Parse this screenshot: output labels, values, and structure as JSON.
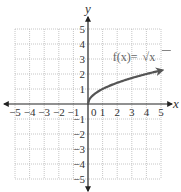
{
  "chart_data": {
    "type": "line",
    "title": "",
    "xlabel": "x",
    "ylabel": "y",
    "xlim": [
      -5,
      5
    ],
    "ylim": [
      -5,
      5
    ],
    "grid": true,
    "grid_style": "dotted",
    "x_ticks": [
      -5,
      -4,
      -3,
      -2,
      -1,
      0,
      1,
      2,
      3,
      4,
      5
    ],
    "y_ticks": [
      -5,
      -4,
      -3,
      -2,
      -1,
      1,
      2,
      3,
      4,
      5
    ],
    "x_tick_labels": [
      "−5",
      "−4",
      "−3",
      "−2",
      "−1",
      "0",
      "1",
      "2",
      "3",
      "4",
      "5"
    ],
    "y_tick_labels": [
      "−5",
      "−4",
      "−3",
      "−2",
      "−1",
      "1",
      "2",
      "3",
      "4",
      "5"
    ],
    "series": [
      {
        "name": "f(x) = √x",
        "function": "sqrt(x)",
        "domain": [
          0,
          5
        ],
        "x": [
          0,
          0.25,
          0.5,
          1,
          1.5,
          2,
          2.5,
          3,
          3.5,
          4,
          4.5,
          5
        ],
        "y": [
          0,
          0.5,
          0.707,
          1,
          1.225,
          1.414,
          1.581,
          1.732,
          1.871,
          2,
          2.121,
          2.236
        ],
        "end_arrow": true,
        "color": "#555555"
      }
    ],
    "annotations": [
      {
        "text_prefix": "f(x)=",
        "text_radical": "√x",
        "x": 1.7,
        "y": 2.9
      }
    ]
  },
  "colors": {
    "axis": "#222222",
    "grid": "#b8b8b8",
    "curve": "#555555",
    "text": "#333333"
  }
}
